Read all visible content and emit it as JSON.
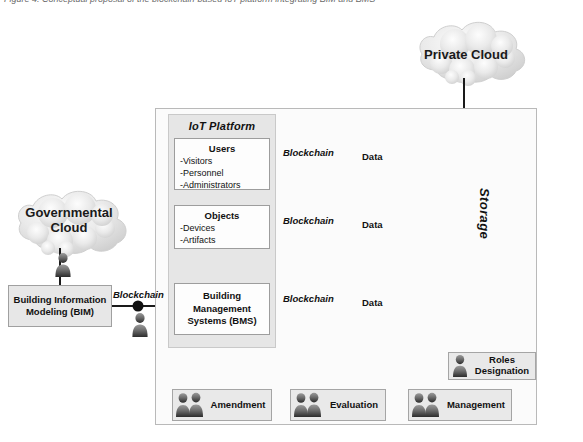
{
  "figure": {
    "caption_fragment": "Figure 4. Conceptual proposal of the blockchain-based IoT platform integrating BIM and BMS"
  },
  "clouds": [
    {
      "id": "private-cloud",
      "label": "Private Cloud"
    },
    {
      "id": "governmental-cloud",
      "label": "Governmental Cloud"
    }
  ],
  "iot_platform": {
    "title": "IoT Platform",
    "blocks": [
      {
        "id": "users",
        "heading": "Users",
        "items": [
          "-Visitors",
          "-Personnel",
          "-Administrators"
        ]
      },
      {
        "id": "objects",
        "heading": "Objects",
        "items": [
          "-Devices",
          "-Artifacts"
        ]
      },
      {
        "id": "bms",
        "heading": "Building Management Systems (BMS)",
        "items": []
      }
    ]
  },
  "bim": {
    "label": "Building Information Modeling (BIM)"
  },
  "storage": {
    "label": "Storage",
    "segments": 9
  },
  "connectors": [
    {
      "id": "users-link",
      "node_label": "Blockchain",
      "flow_label": "Data"
    },
    {
      "id": "objects-link",
      "node_label": "Blockchain",
      "flow_label": "Data"
    },
    {
      "id": "bms-link",
      "node_label": "Blockchain",
      "flow_label": "Data"
    },
    {
      "id": "bim-link",
      "node_label": "Blockchain",
      "flow_label": ""
    }
  ],
  "process_boxes": [
    {
      "id": "amendment",
      "label": "Amendment",
      "actors": 2
    },
    {
      "id": "evaluation",
      "label": "Evaluation",
      "actors": 2
    },
    {
      "id": "management",
      "label": "Management",
      "actors": 2
    },
    {
      "id": "roles-designation",
      "label": "Roles Designation",
      "actors": 1
    }
  ],
  "colors": {
    "box_fill": "#efefef",
    "panel_fill": "#e6e6e6",
    "inner_fill": "#fdfdfd",
    "line": "#1a1a1a",
    "border": "#a8a8a8"
  }
}
